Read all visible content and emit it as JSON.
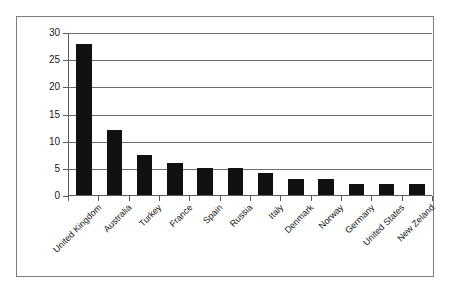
{
  "chart_data": {
    "type": "bar",
    "title": "",
    "subtitle": "",
    "xlabel": "",
    "ylabel": "",
    "ylim": [
      0,
      30
    ],
    "yticks": [
      0,
      5,
      10,
      15,
      20,
      25,
      30
    ],
    "ytick_labels": [
      "0",
      "5",
      "10",
      "15",
      "20",
      "25",
      "30"
    ],
    "grid": true,
    "legend": false,
    "legend_position": "none",
    "bar_color": "#111111",
    "gridline_color": "#6e6e6e",
    "axis_color": "#5a5a5a",
    "frame_color": "#7d7d7d",
    "background_color": "#ffffff",
    "categories": [
      "United Kingdom",
      "Australia",
      "Turkey",
      "France",
      "Spain",
      "Russia",
      "Italy",
      "Denmark",
      "Norway",
      "Germany",
      "United States",
      "New Zeland"
    ],
    "values": [
      28,
      12,
      7.5,
      6,
      5,
      5,
      4,
      3,
      3,
      2,
      2,
      2
    ],
    "series": [
      {
        "name": "",
        "values": [
          28,
          12,
          7.5,
          6,
          5,
          5,
          4,
          3,
          3,
          2,
          2,
          2
        ]
      }
    ]
  }
}
